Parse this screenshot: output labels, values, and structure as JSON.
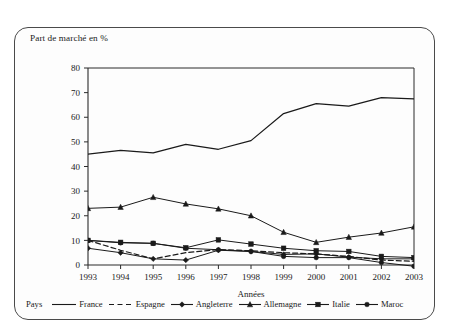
{
  "figure": {
    "plot_title": "Part de marché en %",
    "legend_title": "Pays"
  },
  "chart_data": {
    "type": "line",
    "title": "Part de marché en %",
    "xlabel": "Années",
    "ylabel": "Part de marché en %",
    "categories": [
      "1993",
      "1994",
      "1995",
      "1996",
      "1997",
      "1998",
      "1999",
      "2000",
      "2001",
      "2002",
      "2003"
    ],
    "x": [
      1993,
      1994,
      1995,
      1996,
      1997,
      1998,
      1999,
      2000,
      2001,
      2002,
      2003
    ],
    "ylim": [
      0,
      80
    ],
    "yticks": [
      0,
      10,
      20,
      30,
      40,
      50,
      60,
      70,
      80
    ],
    "grid": false,
    "legend_position": "bottom",
    "series": [
      {
        "name": "France",
        "marker": "none",
        "dash": "solid",
        "values": [
          45,
          46.5,
          45.5,
          49,
          47,
          50.5,
          61.5,
          65.5,
          64.5,
          68,
          67.5
        ]
      },
      {
        "name": "Espagne",
        "marker": "none",
        "dash": "dashed",
        "values": [
          10,
          6,
          2.5,
          5,
          6.3,
          5.8,
          5,
          4.5,
          3.5,
          2,
          1.5
        ]
      },
      {
        "name": "Angleterre",
        "marker": "diamond",
        "dash": "solid",
        "values": [
          6.8,
          5,
          2.5,
          2,
          6,
          5.5,
          4.3,
          4.5,
          3.2,
          2.5,
          2.5
        ]
      },
      {
        "name": "Allemagne",
        "marker": "triangle",
        "dash": "solid",
        "values": [
          23,
          23.5,
          27.5,
          24.8,
          22.8,
          20,
          13.3,
          9.2,
          11.3,
          13,
          15.5
        ]
      },
      {
        "name": "Italie",
        "marker": "square",
        "dash": "solid",
        "values": [
          10,
          9.2,
          8.8,
          7,
          10.2,
          8.5,
          6.8,
          5.8,
          5.5,
          3.5,
          3
        ]
      },
      {
        "name": "Maroc",
        "marker": "circle",
        "dash": "solid",
        "values": [
          10,
          9,
          8.8,
          6.8,
          6.2,
          5.5,
          3.5,
          3,
          3,
          1,
          -0.5
        ]
      }
    ]
  },
  "legend": [
    {
      "label": "France",
      "marker": "none",
      "dash": "solid"
    },
    {
      "label": "Espagne",
      "marker": "none",
      "dash": "dashed"
    },
    {
      "label": "Angleterre",
      "marker": "diamond",
      "dash": "solid"
    },
    {
      "label": "Allemagne",
      "marker": "triangle",
      "dash": "solid"
    },
    {
      "label": "Italie",
      "marker": "square",
      "dash": "solid"
    },
    {
      "label": "Maroc",
      "marker": "circle",
      "dash": "solid"
    }
  ],
  "colors": {
    "line": "#1a1a1a",
    "axis": "#2b2b2b",
    "frame": "#4a4a4a",
    "background": "#fdfdfd"
  }
}
